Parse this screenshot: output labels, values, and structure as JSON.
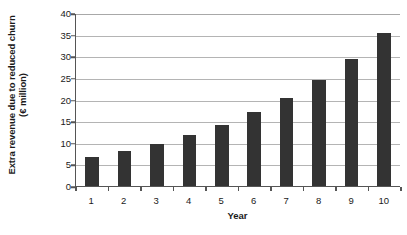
{
  "chart_data": {
    "type": "bar",
    "title": "",
    "subtitle": "",
    "xlabel": "Year",
    "ylabel": "Extra revenue due to reduced churn (€ million)",
    "ylabel_lines": [
      "Extra revenue due to reduced churn",
      "(€ million)"
    ],
    "categories": [
      "1",
      "2",
      "3",
      "4",
      "5",
      "6",
      "7",
      "8",
      "9",
      "10"
    ],
    "values": [
      6.7,
      8.1,
      9.8,
      11.7,
      14.2,
      17.0,
      20.3,
      24.5,
      29.3,
      35.3
    ],
    "ylim": [
      0,
      40
    ],
    "ytick_values": [
      0,
      5,
      10,
      15,
      20,
      25,
      30,
      35,
      40
    ],
    "ytick_labels": [
      "0",
      "5",
      "10",
      "15",
      "20",
      "25",
      "30",
      "35",
      "40"
    ],
    "grid": "horizontal",
    "legend": "none",
    "bar_color": "#333333",
    "gridline_color": "#b4b4b4",
    "axis_color": "#555555",
    "background_color": "#ffffff"
  }
}
